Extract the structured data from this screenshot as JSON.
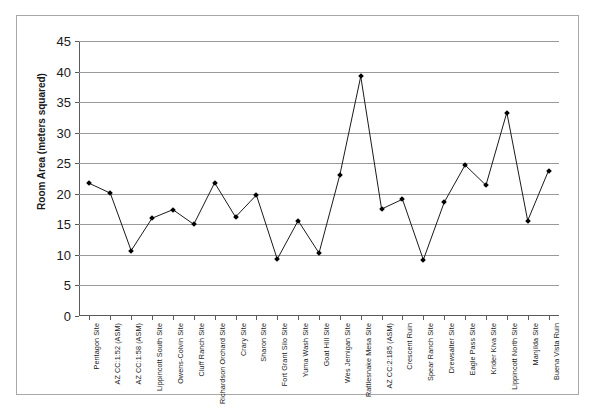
{
  "chart_data": {
    "type": "line",
    "title": "",
    "xlabel": "",
    "ylabel": "Room Area (meters squared)",
    "ylim": [
      0,
      45
    ],
    "ytick_step": 5,
    "yticks": [
      "0",
      "5",
      "10",
      "15",
      "20",
      "25",
      "30",
      "35",
      "40",
      "45"
    ],
    "grid": true,
    "legend": "none",
    "marker": "diamond",
    "line_color": "#1a1a1a",
    "marker_color": "#000000",
    "grid_color": "#9a9a9a",
    "categories": [
      "Pentagon Site",
      "AZ CC:1:52 (ASM)",
      "AZ CC:1:58 (ASM)",
      "Lippincott South Site",
      "Owens-Colvin Site",
      "Cluff Ranch Site",
      "Richardson Orchard Site",
      "Crary Site",
      "Sharon Site",
      "Fort Grant Silo Site",
      "Yuma Wash Site",
      "Goat Hill Site",
      "Wes Jernigan Site",
      "Rattlesnake Mesa Site",
      "AZ CC:2:185 (ASM)",
      "Crescent Ruin",
      "Spear Ranch Site",
      "Drewsalter Site",
      "Eagle Pass Site",
      "Krider Kiva Site",
      "Lippincott North Site",
      "Manjilda Site",
      "Buena Vista Ruin"
    ],
    "values": [
      21.7,
      20.1,
      10.7,
      16.0,
      17.4,
      15.0,
      21.8,
      16.2,
      19.8,
      9.3,
      15.6,
      10.3,
      23.1,
      39.2,
      17.5,
      19.1,
      9.2,
      18.6,
      24.7,
      21.4,
      33.3,
      15.6,
      23.8
    ]
  }
}
